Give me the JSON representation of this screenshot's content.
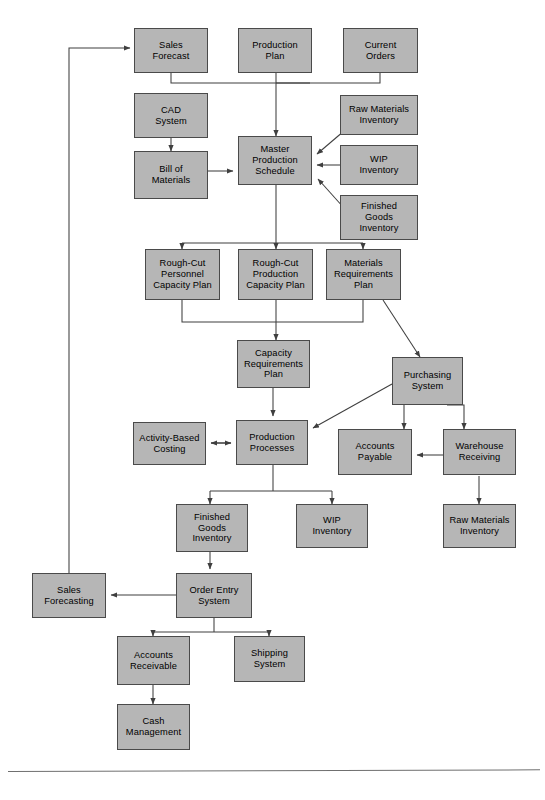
{
  "diagram": {
    "title": "",
    "box_fill": "#b6b6b6",
    "box_border": "#4a4a4a",
    "line_color": "#3f3f3f",
    "nodes": [
      {
        "id": "sales-forecast",
        "label": "Sales\nForecast"
      },
      {
        "id": "production-plan",
        "label": "Production\nPlan"
      },
      {
        "id": "current-orders",
        "label": "Current\nOrders"
      },
      {
        "id": "cad-system",
        "label": "CAD\nSystem"
      },
      {
        "id": "bill-of-materials",
        "label": "Bill of\nMaterials"
      },
      {
        "id": "master-production-schedule",
        "label": "Master\nProduction\nSchedule"
      },
      {
        "id": "raw-materials-inventory-top",
        "label": "Raw Materials\nInventory"
      },
      {
        "id": "wip-inventory-top",
        "label": "WIP\nInventory"
      },
      {
        "id": "finished-goods-inventory-top",
        "label": "Finished\nGoods\nInventory"
      },
      {
        "id": "rough-cut-personnel-capacity-plan",
        "label": "Rough-Cut\nPersonnel\nCapacity Plan"
      },
      {
        "id": "rough-cut-production-capacity-plan",
        "label": "Rough-Cut\nProduction\nCapacity Plan"
      },
      {
        "id": "materials-requirements-plan",
        "label": "Materials\nRequirements\nPlan"
      },
      {
        "id": "capacity-requirements-plan",
        "label": "Capacity\nRequirements\nPlan"
      },
      {
        "id": "purchasing-system",
        "label": "Purchasing\nSystem"
      },
      {
        "id": "activity-based-costing",
        "label": "Activity-Based\nCosting"
      },
      {
        "id": "production-processes",
        "label": "Production\nProcesses"
      },
      {
        "id": "accounts-payable",
        "label": "Accounts\nPayable"
      },
      {
        "id": "warehouse-receiving",
        "label": "Warehouse\nReceiving"
      },
      {
        "id": "finished-goods-inventory-bottom",
        "label": "Finished\nGoods\nInventory"
      },
      {
        "id": "wip-inventory-bottom",
        "label": "WIP\nInventory"
      },
      {
        "id": "raw-materials-inventory-bottom",
        "label": "Raw Materials\nInventory"
      },
      {
        "id": "sales-forecasting",
        "label": "Sales\nForecasting"
      },
      {
        "id": "order-entry-system",
        "label": "Order Entry\nSystem"
      },
      {
        "id": "accounts-receivable",
        "label": "Accounts\nReceivable"
      },
      {
        "id": "shipping-system",
        "label": "Shipping\nSystem"
      },
      {
        "id": "cash-management",
        "label": "Cash\nManagement"
      }
    ],
    "edges": [
      {
        "from": "sales-forecast",
        "to": "master-production-schedule"
      },
      {
        "from": "production-plan",
        "to": "master-production-schedule"
      },
      {
        "from": "current-orders",
        "to": "master-production-schedule"
      },
      {
        "from": "cad-system",
        "to": "bill-of-materials"
      },
      {
        "from": "bill-of-materials",
        "to": "master-production-schedule"
      },
      {
        "from": "raw-materials-inventory-top",
        "to": "master-production-schedule"
      },
      {
        "from": "wip-inventory-top",
        "to": "master-production-schedule"
      },
      {
        "from": "finished-goods-inventory-top",
        "to": "master-production-schedule"
      },
      {
        "from": "master-production-schedule",
        "to": "rough-cut-personnel-capacity-plan"
      },
      {
        "from": "master-production-schedule",
        "to": "rough-cut-production-capacity-plan"
      },
      {
        "from": "master-production-schedule",
        "to": "materials-requirements-plan"
      },
      {
        "from": "rough-cut-personnel-capacity-plan",
        "to": "capacity-requirements-plan"
      },
      {
        "from": "rough-cut-production-capacity-plan",
        "to": "capacity-requirements-plan"
      },
      {
        "from": "materials-requirements-plan",
        "to": "capacity-requirements-plan"
      },
      {
        "from": "materials-requirements-plan",
        "to": "purchasing-system"
      },
      {
        "from": "capacity-requirements-plan",
        "to": "production-processes"
      },
      {
        "from": "activity-based-costing",
        "to": "production-processes",
        "bidirectional": true
      },
      {
        "from": "purchasing-system",
        "to": "production-processes"
      },
      {
        "from": "purchasing-system",
        "to": "accounts-payable"
      },
      {
        "from": "purchasing-system",
        "to": "warehouse-receiving"
      },
      {
        "from": "warehouse-receiving",
        "to": "accounts-payable"
      },
      {
        "from": "warehouse-receiving",
        "to": "raw-materials-inventory-bottom"
      },
      {
        "from": "production-processes",
        "to": "finished-goods-inventory-bottom"
      },
      {
        "from": "production-processes",
        "to": "wip-inventory-bottom"
      },
      {
        "from": "finished-goods-inventory-bottom",
        "to": "order-entry-system"
      },
      {
        "from": "order-entry-system",
        "to": "sales-forecasting"
      },
      {
        "from": "order-entry-system",
        "to": "accounts-receivable"
      },
      {
        "from": "order-entry-system",
        "to": "shipping-system"
      },
      {
        "from": "accounts-receivable",
        "to": "cash-management"
      },
      {
        "from": "sales-forecasting",
        "to": "sales-forecast"
      }
    ]
  }
}
